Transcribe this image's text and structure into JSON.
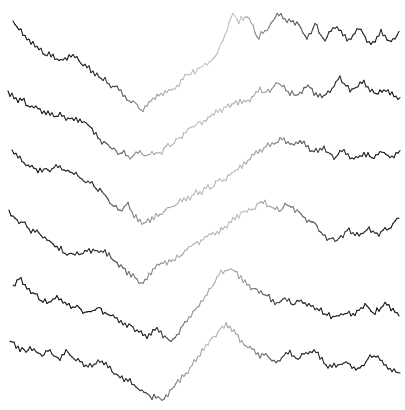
{
  "page": {
    "background": "#ffffff",
    "width_px": 405,
    "height_px": 410
  },
  "chart_data": {
    "type": "line",
    "title": "",
    "xlabel": "",
    "ylabel": "",
    "axes_visible": false,
    "grid": false,
    "legend": false,
    "background": "#ffffff",
    "x_range_px": [
      5,
      402
    ],
    "y_range_px": [
      5,
      405
    ],
    "style": {
      "line_width_px": 1.1,
      "noise_amplitude_px": 5,
      "noise_reversion": 0.55,
      "step_px": 2,
      "shade_flicker": 0.1,
      "dark_hex": "#161616",
      "light_hex": "#d6d6d6"
    },
    "series": [
      {
        "name": "trace-1",
        "seed": 11,
        "anchors_px": [
          [
            13,
            23
          ],
          [
            22,
            34
          ],
          [
            30,
            42
          ],
          [
            40,
            50
          ],
          [
            50,
            55
          ],
          [
            62,
            60
          ],
          [
            72,
            57
          ],
          [
            82,
            66
          ],
          [
            95,
            74
          ],
          [
            105,
            79
          ],
          [
            115,
            86
          ],
          [
            125,
            95
          ],
          [
            133,
            103
          ],
          [
            140,
            110
          ],
          [
            148,
            103
          ],
          [
            156,
            97
          ],
          [
            164,
            92
          ],
          [
            172,
            88
          ],
          [
            180,
            80
          ],
          [
            190,
            75
          ],
          [
            200,
            70
          ],
          [
            210,
            62
          ],
          [
            218,
            52
          ],
          [
            226,
            32
          ],
          [
            232,
            12
          ],
          [
            238,
            22
          ],
          [
            246,
            14
          ],
          [
            252,
            24
          ],
          [
            258,
            40
          ],
          [
            268,
            25
          ],
          [
            278,
            12
          ],
          [
            288,
            18
          ],
          [
            298,
            24
          ],
          [
            306,
            36
          ],
          [
            315,
            24
          ],
          [
            325,
            40
          ],
          [
            335,
            26
          ],
          [
            347,
            42
          ],
          [
            358,
            28
          ],
          [
            370,
            44
          ],
          [
            380,
            30
          ],
          [
            390,
            42
          ],
          [
            400,
            31
          ]
        ],
        "shade_profile": [
          [
            0,
            0.08
          ],
          [
            90,
            0.13
          ],
          [
            115,
            0.3
          ],
          [
            140,
            0.55
          ],
          [
            165,
            0.68
          ],
          [
            195,
            0.75
          ],
          [
            235,
            0.78
          ],
          [
            258,
            0.55
          ],
          [
            285,
            0.4
          ],
          [
            305,
            0.28
          ],
          [
            330,
            0.18
          ],
          [
            405,
            0.08
          ]
        ]
      },
      {
        "name": "trace-2",
        "seed": 22,
        "anchors_px": [
          [
            8,
            93
          ],
          [
            18,
            99
          ],
          [
            28,
            106
          ],
          [
            40,
            111
          ],
          [
            52,
            113
          ],
          [
            64,
            117
          ],
          [
            76,
            121
          ],
          [
            88,
            127
          ],
          [
            98,
            134
          ],
          [
            108,
            144
          ],
          [
            118,
            151
          ],
          [
            128,
            157
          ],
          [
            138,
            152
          ],
          [
            148,
            157
          ],
          [
            158,
            152
          ],
          [
            168,
            147
          ],
          [
            178,
            141
          ],
          [
            188,
            132
          ],
          [
            198,
            124
          ],
          [
            208,
            118
          ],
          [
            218,
            112
          ],
          [
            228,
            109
          ],
          [
            238,
            104
          ],
          [
            248,
            98
          ],
          [
            258,
            93
          ],
          [
            268,
            89
          ],
          [
            278,
            85
          ],
          [
            288,
            90
          ],
          [
            298,
            94
          ],
          [
            308,
            87
          ],
          [
            318,
            97
          ],
          [
            328,
            91
          ],
          [
            340,
            80
          ],
          [
            352,
            91
          ],
          [
            364,
            85
          ],
          [
            375,
            96
          ],
          [
            386,
            92
          ],
          [
            395,
            97
          ],
          [
            400,
            96
          ]
        ],
        "shade_profile": [
          [
            0,
            0.08
          ],
          [
            90,
            0.14
          ],
          [
            115,
            0.38
          ],
          [
            140,
            0.6
          ],
          [
            175,
            0.72
          ],
          [
            215,
            0.75
          ],
          [
            250,
            0.68
          ],
          [
            280,
            0.52
          ],
          [
            305,
            0.35
          ],
          [
            330,
            0.2
          ],
          [
            405,
            0.08
          ]
        ]
      },
      {
        "name": "trace-3",
        "seed": 33,
        "anchors_px": [
          [
            12,
            152
          ],
          [
            22,
            160
          ],
          [
            32,
            167
          ],
          [
            44,
            171
          ],
          [
            56,
            169
          ],
          [
            68,
            173
          ],
          [
            80,
            179
          ],
          [
            92,
            186
          ],
          [
            102,
            193
          ],
          [
            112,
            204
          ],
          [
            120,
            211
          ],
          [
            128,
            204
          ],
          [
            136,
            216
          ],
          [
            144,
            227
          ],
          [
            152,
            219
          ],
          [
            160,
            212
          ],
          [
            170,
            207
          ],
          [
            180,
            201
          ],
          [
            192,
            197
          ],
          [
            204,
            190
          ],
          [
            216,
            184
          ],
          [
            228,
            176
          ],
          [
            240,
            168
          ],
          [
            252,
            158
          ],
          [
            263,
            151
          ],
          [
            274,
            145
          ],
          [
            283,
            140
          ],
          [
            293,
            148
          ],
          [
            303,
            143
          ],
          [
            313,
            153
          ],
          [
            323,
            147
          ],
          [
            333,
            157
          ],
          [
            343,
            149
          ],
          [
            353,
            159
          ],
          [
            363,
            151
          ],
          [
            373,
            158
          ],
          [
            383,
            152
          ],
          [
            393,
            157
          ],
          [
            400,
            151
          ]
        ],
        "shade_profile": [
          [
            0,
            0.08
          ],
          [
            95,
            0.16
          ],
          [
            120,
            0.4
          ],
          [
            145,
            0.58
          ],
          [
            185,
            0.72
          ],
          [
            235,
            0.74
          ],
          [
            270,
            0.58
          ],
          [
            295,
            0.38
          ],
          [
            320,
            0.22
          ],
          [
            350,
            0.14
          ],
          [
            405,
            0.08
          ]
        ]
      },
      {
        "name": "trace-4",
        "seed": 44,
        "anchors_px": [
          [
            9,
            212
          ],
          [
            18,
            219
          ],
          [
            28,
            227
          ],
          [
            38,
            234
          ],
          [
            48,
            241
          ],
          [
            58,
            248
          ],
          [
            68,
            253
          ],
          [
            78,
            255
          ],
          [
            88,
            252
          ],
          [
            98,
            249
          ],
          [
            108,
            255
          ],
          [
            118,
            263
          ],
          [
            128,
            271
          ],
          [
            140,
            280
          ],
          [
            150,
            274
          ],
          [
            160,
            267
          ],
          [
            170,
            261
          ],
          [
            180,
            256
          ],
          [
            190,
            249
          ],
          [
            200,
            242
          ],
          [
            210,
            236
          ],
          [
            220,
            229
          ],
          [
            230,
            222
          ],
          [
            240,
            215
          ],
          [
            250,
            209
          ],
          [
            260,
            204
          ],
          [
            270,
            207
          ],
          [
            278,
            212
          ],
          [
            286,
            205
          ],
          [
            294,
            209
          ],
          [
            302,
            215
          ],
          [
            310,
            221
          ],
          [
            318,
            228
          ],
          [
            326,
            236
          ],
          [
            336,
            242
          ],
          [
            348,
            230
          ],
          [
            358,
            236
          ],
          [
            368,
            227
          ],
          [
            378,
            232
          ],
          [
            388,
            228
          ],
          [
            400,
            216
          ]
        ],
        "shade_profile": [
          [
            0,
            0.08
          ],
          [
            100,
            0.16
          ],
          [
            125,
            0.4
          ],
          [
            155,
            0.58
          ],
          [
            195,
            0.7
          ],
          [
            245,
            0.76
          ],
          [
            280,
            0.55
          ],
          [
            305,
            0.38
          ],
          [
            330,
            0.22
          ],
          [
            405,
            0.08
          ]
        ]
      },
      {
        "name": "trace-5",
        "seed": 55,
        "anchors_px": [
          [
            13,
            287
          ],
          [
            21,
            281
          ],
          [
            29,
            291
          ],
          [
            38,
            296
          ],
          [
            48,
            301
          ],
          [
            58,
            297
          ],
          [
            68,
            303
          ],
          [
            78,
            308
          ],
          [
            88,
            313
          ],
          [
            98,
            309
          ],
          [
            108,
            315
          ],
          [
            118,
            321
          ],
          [
            128,
            326
          ],
          [
            138,
            331
          ],
          [
            148,
            336
          ],
          [
            156,
            332
          ],
          [
            164,
            338
          ],
          [
            172,
            341
          ],
          [
            180,
            330
          ],
          [
            188,
            320
          ],
          [
            196,
            309
          ],
          [
            204,
            297
          ],
          [
            212,
            286
          ],
          [
            220,
            275
          ],
          [
            228,
            265
          ],
          [
            236,
            272
          ],
          [
            244,
            280
          ],
          [
            252,
            286
          ],
          [
            260,
            291
          ],
          [
            268,
            297
          ],
          [
            276,
            304
          ],
          [
            284,
            298
          ],
          [
            292,
            303
          ],
          [
            300,
            300
          ],
          [
            308,
            306
          ],
          [
            316,
            311
          ],
          [
            324,
            314
          ],
          [
            334,
            318
          ],
          [
            344,
            311
          ],
          [
            354,
            317
          ],
          [
            364,
            307
          ],
          [
            374,
            313
          ],
          [
            384,
            306
          ],
          [
            392,
            311
          ],
          [
            400,
            312
          ]
        ],
        "shade_profile": [
          [
            0,
            0.08
          ],
          [
            150,
            0.13
          ],
          [
            172,
            0.35
          ],
          [
            195,
            0.6
          ],
          [
            220,
            0.72
          ],
          [
            240,
            0.62
          ],
          [
            258,
            0.45
          ],
          [
            275,
            0.28
          ],
          [
            300,
            0.15
          ],
          [
            405,
            0.08
          ]
        ]
      },
      {
        "name": "trace-6",
        "seed": 66,
        "anchors_px": [
          [
            10,
            343
          ],
          [
            18,
            349
          ],
          [
            26,
            353
          ],
          [
            34,
            349
          ],
          [
            42,
            355
          ],
          [
            50,
            352
          ],
          [
            58,
            357
          ],
          [
            66,
            353
          ],
          [
            74,
            359
          ],
          [
            82,
            363
          ],
          [
            90,
            366
          ],
          [
            98,
            362
          ],
          [
            106,
            367
          ],
          [
            114,
            372
          ],
          [
            122,
            377
          ],
          [
            130,
            382
          ],
          [
            138,
            388
          ],
          [
            146,
            393
          ],
          [
            154,
            397
          ],
          [
            162,
            400
          ],
          [
            170,
            392
          ],
          [
            178,
            383
          ],
          [
            186,
            373
          ],
          [
            194,
            362
          ],
          [
            202,
            351
          ],
          [
            210,
            341
          ],
          [
            218,
            331
          ],
          [
            226,
            324
          ],
          [
            234,
            333
          ],
          [
            242,
            342
          ],
          [
            250,
            349
          ],
          [
            258,
            354
          ],
          [
            266,
            358
          ],
          [
            274,
            362
          ],
          [
            282,
            359
          ],
          [
            290,
            355
          ],
          [
            298,
            361
          ],
          [
            306,
            355
          ],
          [
            314,
            352
          ],
          [
            322,
            359
          ],
          [
            330,
            365
          ],
          [
            338,
            368
          ],
          [
            346,
            361
          ],
          [
            354,
            365
          ],
          [
            362,
            366
          ],
          [
            370,
            357
          ],
          [
            378,
            360
          ],
          [
            386,
            363
          ],
          [
            394,
            370
          ],
          [
            400,
            372
          ]
        ],
        "shade_profile": [
          [
            0,
            0.1
          ],
          [
            135,
            0.15
          ],
          [
            158,
            0.4
          ],
          [
            185,
            0.6
          ],
          [
            215,
            0.74
          ],
          [
            240,
            0.62
          ],
          [
            260,
            0.45
          ],
          [
            280,
            0.28
          ],
          [
            300,
            0.16
          ],
          [
            405,
            0.08
          ]
        ]
      }
    ]
  }
}
